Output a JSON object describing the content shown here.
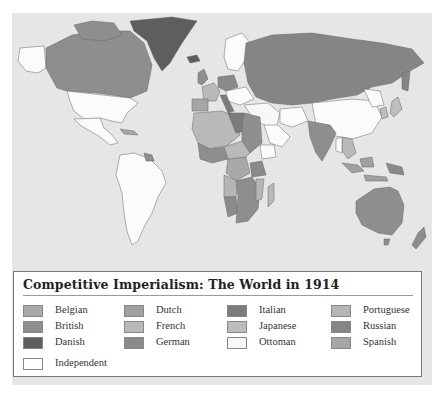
{
  "map": {
    "title": "Competitive Imperialism: The World in 1914",
    "ocean_color": "#e6e6e6",
    "border_color": "#555555"
  },
  "legend": {
    "title": "Competitive Imperialism: The World in 1914",
    "items": [
      {
        "label": "Belgian",
        "color": "#a9a9a9"
      },
      {
        "label": "British",
        "color": "#8e8e8e"
      },
      {
        "label": "Danish",
        "color": "#5e5e5e"
      },
      {
        "label": "Dutch",
        "color": "#a0a0a0"
      },
      {
        "label": "French",
        "color": "#b9b9b9"
      },
      {
        "label": "German",
        "color": "#8a8a8a"
      },
      {
        "label": "Italian",
        "color": "#7c7c7c"
      },
      {
        "label": "Japanese",
        "color": "#bdbdbd"
      },
      {
        "label": "Ottoman",
        "color": "#f7f7f7"
      },
      {
        "label": "Portuguese",
        "color": "#b5b5b5"
      },
      {
        "label": "Russian",
        "color": "#858585"
      },
      {
        "label": "Spanish",
        "color": "#a6a6a6"
      },
      {
        "label": "Independent",
        "color": "#ffffff"
      }
    ]
  }
}
